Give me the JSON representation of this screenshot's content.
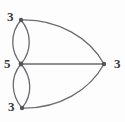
{
  "figure": {
    "kind": "multigraph-degree-diagram",
    "background_color": "#fdfdfd",
    "edge_color": "#6b6b70",
    "vertex_color": "#555559",
    "label_color": "#3a3a3c",
    "width": 125,
    "height": 122
  },
  "graph": {
    "vertices": [
      {
        "id": "top",
        "label": "3",
        "x": 21,
        "y": 20,
        "degree": 3
      },
      {
        "id": "middle",
        "label": "5",
        "x": 21,
        "y": 64,
        "degree": 5
      },
      {
        "id": "bottom",
        "label": "3",
        "x": 22,
        "y": 108,
        "degree": 3
      },
      {
        "id": "right",
        "label": "3",
        "x": 104,
        "y": 64,
        "degree": 3
      }
    ],
    "edges": [
      {
        "id": "e1",
        "from": "top",
        "to": "middle",
        "style": "curve-left",
        "path": "M21,20 C10,33 10,51 21,64"
      },
      {
        "id": "e2",
        "from": "top",
        "to": "middle",
        "style": "curve-right",
        "path": "M21,20 C32,33 32,51 21,64"
      },
      {
        "id": "e3",
        "from": "middle",
        "to": "bottom",
        "style": "curve-left",
        "path": "M21,64 C10,77 11,95 22,108"
      },
      {
        "id": "e4",
        "from": "middle",
        "to": "bottom",
        "style": "curve-right",
        "path": "M21,64 C32,77 33,95 22,108"
      },
      {
        "id": "e5",
        "from": "top",
        "to": "right",
        "style": "curve-outer-up",
        "path": "M21,20 C58,19 90,38 104,64"
      },
      {
        "id": "e6",
        "from": "middle",
        "to": "right",
        "style": "straight",
        "path": "M21,64 L104,64"
      },
      {
        "id": "e7",
        "from": "bottom",
        "to": "right",
        "style": "curve-outer-down",
        "path": "M22,108 C59,109 90,90 104,64"
      }
    ],
    "vertex_radius": 2.2,
    "edge_width": 1.3
  }
}
